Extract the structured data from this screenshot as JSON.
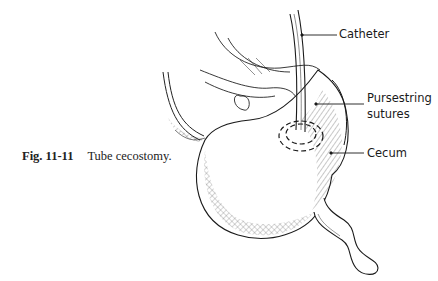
{
  "figure": {
    "number": "Fig. 11-11",
    "title": "Tube cecostomy.",
    "illustration": "cecum-with-catheter-drawing"
  },
  "labels": {
    "catheter": "Catheter",
    "pursestring_line1": "Pursestring",
    "pursestring_line2": "sutures",
    "cecum": "Cecum"
  },
  "colors": {
    "ink": "#1a1a1a",
    "background": "#ffffff"
  }
}
